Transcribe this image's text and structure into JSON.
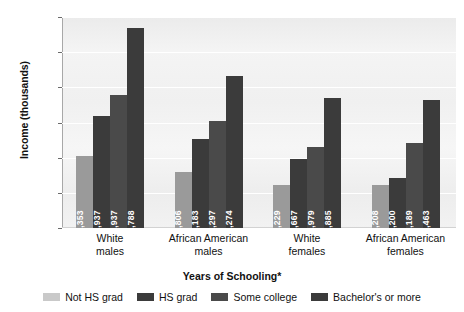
{
  "chart_data": {
    "type": "bar",
    "title": "",
    "xlabel": "Years of Schooling*",
    "ylabel": "Income (thousands)",
    "ylim": [
      0,
      60
    ],
    "yticks": [
      0,
      10,
      20,
      30,
      40,
      50,
      60
    ],
    "ytick_labels": [
      "$0",
      "$10",
      "$20",
      "$30",
      "$40",
      "$50",
      "$60"
    ],
    "grid": true,
    "legend_position": "bottom",
    "categories": [
      "White\nmales",
      "African American\nmales",
      "White\nfemales",
      "African American\nfemales"
    ],
    "category_lines": [
      [
        "White",
        "males"
      ],
      [
        "African American",
        "males"
      ],
      [
        "White",
        "females"
      ],
      [
        "African American",
        "females"
      ]
    ],
    "series": [
      {
        "name": "Not HS grad",
        "color": "#9a9a9a",
        "values": [
          20353,
          15806,
          12229,
          12208
        ],
        "labels": [
          "20,353",
          "15,806",
          "12,229",
          "12,208"
        ]
      },
      {
        "name": "HS grad",
        "color": "#3b3b3b",
        "values": [
          31937,
          25183,
          19667,
          14200
        ],
        "labels": [
          "31,937",
          "25,183",
          "19,667",
          "14,200"
        ]
      },
      {
        "name": "Some college",
        "color": "#4a4a4a",
        "values": [
          37937,
          30297,
          22979,
          24189
        ],
        "labels": [
          "37,937",
          "30,297",
          "22,979",
          "24,189"
        ]
      },
      {
        "name": "Bachelor's or more",
        "color": "#3b3b3b",
        "values": [
          56788,
          43274,
          36885,
          36463
        ],
        "labels": [
          "56,788",
          "43,274",
          "36,885",
          "36,463"
        ]
      }
    ]
  },
  "legend": {
    "swatch_colors": [
      "#c9c9c9",
      "#3b3b3b",
      "#4a4a4a",
      "#3b3b3b"
    ]
  }
}
